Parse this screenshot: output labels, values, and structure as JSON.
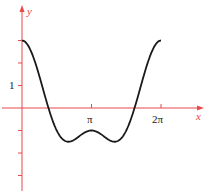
{
  "chart_data": {
    "type": "line",
    "title": "",
    "function": "y = 2cos(x) + cos(2x)",
    "xlabel": "x",
    "ylabel": "y",
    "x_tick_labels": [
      "π",
      "2π"
    ],
    "x_ticks": [
      3.14159,
      6.28319
    ],
    "y_tick_labels": [
      "1"
    ],
    "y_ticks": [
      -3,
      -2,
      -1,
      1,
      2,
      3
    ],
    "xlim": [
      -0.3,
      8.2
    ],
    "ylim": [
      -3.7,
      4.6
    ],
    "grid": false,
    "legend": null,
    "series": [
      {
        "name": "curve",
        "x": [
          0,
          0.785,
          1.571,
          2.094,
          2.618,
          3.142,
          3.665,
          4.189,
          4.712,
          5.498,
          6.283
        ],
        "y": [
          3,
          1.414,
          -1,
          -1.5,
          -1.232,
          -1,
          -1.232,
          -1.5,
          -1,
          1.414,
          3
        ]
      }
    ],
    "colors": {
      "axis": "#e8484e",
      "curve": "#1a1a1a",
      "text": "#222222"
    }
  },
  "labels": {
    "y_axis": "y",
    "x_axis": "x",
    "pi": "π",
    "two_pi": "2π",
    "one": "1"
  }
}
